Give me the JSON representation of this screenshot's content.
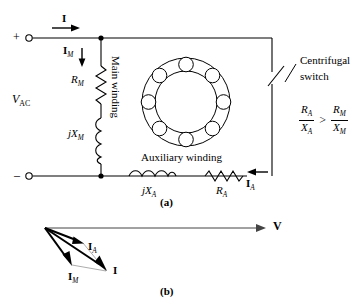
{
  "figure": {
    "panel_a_caption": "(a)",
    "panel_b_caption": "(b)"
  },
  "circuit": {
    "source_label_main": "V",
    "source_label_sub": "AC",
    "terminal_plus": "+",
    "terminal_minus": "–",
    "line_current_label": "I",
    "main_branch_current": "I",
    "main_branch_current_sub": "M",
    "aux_branch_current": "I",
    "aux_branch_current_sub": "A",
    "resistor_main": "R",
    "resistor_main_sub": "M",
    "reactance_main": "jX",
    "reactance_main_sub": "M",
    "resistor_aux": "R",
    "resistor_aux_sub": "A",
    "reactance_aux": "jX",
    "reactance_aux_sub": "A",
    "main_winding_label": "Main winding",
    "auxiliary_winding_label": "Auxiliary winding",
    "switch_label_line1": "Centrifugal",
    "switch_label_line2": "switch",
    "inequality": {
      "left_numerator": "R",
      "left_numerator_sub": "A",
      "left_denominator": "X",
      "left_denominator_sub": "A",
      "operator": ">",
      "right_numerator": "R",
      "right_numerator_sub": "M",
      "right_denominator": "X",
      "right_denominator_sub": "M"
    },
    "stator_slot_count": 8
  },
  "phasor": {
    "voltage_label": "V",
    "aux_current_label": "I",
    "aux_current_sub": "A",
    "main_current_label": "I",
    "main_current_sub": "M",
    "total_current_label": "I",
    "vectors": [
      {
        "name": "V",
        "from": [
          45,
          228
        ],
        "to": [
          265,
          228
        ]
      },
      {
        "name": "I_A",
        "from": [
          45,
          228
        ],
        "to": [
          83,
          243
        ]
      },
      {
        "name": "I_M",
        "from": [
          45,
          228
        ],
        "to": [
          72,
          265
        ]
      },
      {
        "name": "I",
        "from": [
          45,
          228
        ],
        "to": [
          106,
          271
        ]
      }
    ]
  },
  "colors": {
    "ink": "#000000",
    "background": "#ffffff",
    "thin_line": "#555555"
  }
}
